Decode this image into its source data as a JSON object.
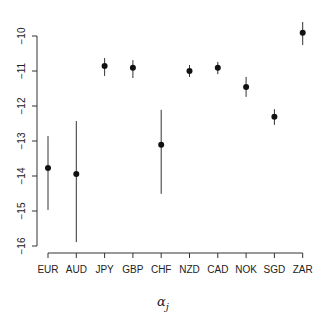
{
  "chart_data": {
    "type": "scatter",
    "subtype": "point-range",
    "title": "",
    "xlabel": "α_j",
    "xlabel_main": "α",
    "xlabel_sub": "j",
    "ylabel": "",
    "ylim": [
      -16,
      -10
    ],
    "yticks": [
      -10,
      -11,
      -12,
      -13,
      -14,
      -15,
      -16
    ],
    "grid": false,
    "legend": null,
    "categories": [
      "EUR",
      "AUD",
      "JPY",
      "GBP",
      "CHF",
      "NZD",
      "CAD",
      "NOK",
      "SGD",
      "ZAR"
    ],
    "series": [
      {
        "name": "alpha_j",
        "values": [
          -13.77,
          -13.94,
          -10.86,
          -10.91,
          -13.11,
          -11.0,
          -10.91,
          -11.46,
          -12.31,
          -9.91
        ],
        "upper": [
          -12.86,
          -12.43,
          -10.63,
          -10.69,
          -12.11,
          -10.83,
          -10.74,
          -11.17,
          -12.09,
          -9.6
        ],
        "lower": [
          -14.97,
          -15.89,
          -11.14,
          -11.2,
          -14.51,
          -11.17,
          -11.09,
          -11.74,
          -12.54,
          -10.26
        ]
      }
    ]
  },
  "colors": {
    "axis": "#333333",
    "point": "#111111",
    "bar": "#333333"
  }
}
